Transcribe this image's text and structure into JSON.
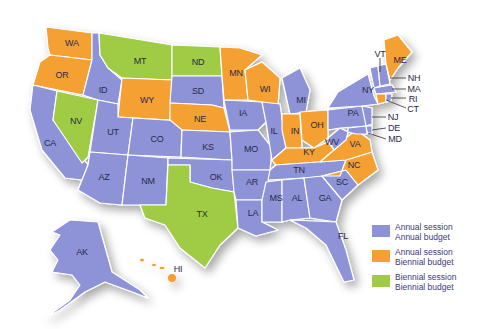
{
  "map": {
    "type": "choropleth",
    "subject": "US state legislative session and budget cycles",
    "colors": {
      "annual_session_annual_budget": "#8d93d6",
      "annual_session_biennial_budget": "#f5a033",
      "biennial_session_biennial_budget": "#9fcb45"
    },
    "categories": {
      "annual_session_annual_budget": [
        "AK",
        "AL",
        "AZ",
        "AR",
        "CA",
        "CO",
        "DE",
        "FL",
        "GA",
        "ID",
        "IL",
        "IA",
        "KS",
        "LA",
        "MD",
        "MA",
        "MI",
        "MS",
        "MO",
        "NH",
        "NJ",
        "NM",
        "NY",
        "OK",
        "PA",
        "RI",
        "SC",
        "SD",
        "TN",
        "UT",
        "VT",
        "WV"
      ],
      "annual_session_biennial_budget": [
        "CT",
        "HI",
        "IN",
        "KY",
        "ME",
        "MN",
        "NE",
        "NC",
        "OH",
        "OR",
        "VA",
        "WA",
        "WI",
        "WY"
      ],
      "biennial_session_biennial_budget": [
        "MT",
        "ND",
        "NV",
        "TX"
      ]
    }
  },
  "labels": {
    "WA": "WA",
    "OR": "OR",
    "CA": "CA",
    "ID": "ID",
    "NV": "NV",
    "MT": "MT",
    "WY": "WY",
    "UT": "UT",
    "AZ": "AZ",
    "CO": "CO",
    "NM": "NM",
    "ND": "ND",
    "SD": "SD",
    "NE": "NE",
    "KS": "KS",
    "OK": "OK",
    "TX": "TX",
    "MN": "MN",
    "IA": "IA",
    "MO": "MO",
    "AR": "AR",
    "LA": "LA",
    "WI": "WI",
    "IL": "IL",
    "MI": "MI",
    "IN": "IN",
    "OH": "OH",
    "KY": "KY",
    "TN": "TN",
    "MS": "MS",
    "AL": "AL",
    "GA": "GA",
    "FL": "FL",
    "SC": "SC",
    "NC": "NC",
    "VA": "VA",
    "WV": "WV",
    "PA": "PA",
    "NY": "NY",
    "VT": "VT",
    "ME": "ME",
    "NH": "NH",
    "MA": "MA",
    "RI": "RI",
    "CT": "CT",
    "NJ": "NJ",
    "DE": "DE",
    "MD": "MD",
    "AK": "AK",
    "HI": "HI"
  },
  "legend": [
    {
      "line1": "Annual session",
      "line2": "Annual budget",
      "color": "#8d93d6"
    },
    {
      "line1": "Annual session",
      "line2": "Biennial budget",
      "color": "#f5a033"
    },
    {
      "line1": "Biennial session",
      "line2": "Biennial budget",
      "color": "#9fcb45"
    }
  ]
}
